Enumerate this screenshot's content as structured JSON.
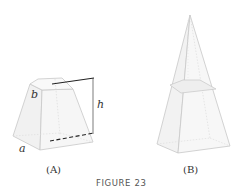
{
  "figure": {
    "caption": "FIGURE 23",
    "panels": [
      {
        "id": "A",
        "label": "(A)",
        "shape": "frustum",
        "dimension_labels": {
          "top_side": "b",
          "bottom_side": "a",
          "height": "h"
        }
      },
      {
        "id": "B",
        "label": "(B)",
        "shape": "pyramid-with-cut-plane"
      }
    ]
  },
  "colors": {
    "edge": "#c8c8c8",
    "face_fill": "#f3f3f3",
    "face_fill_light": "#f8f8f8",
    "dimension_line": "#222222",
    "text": "#333333"
  }
}
